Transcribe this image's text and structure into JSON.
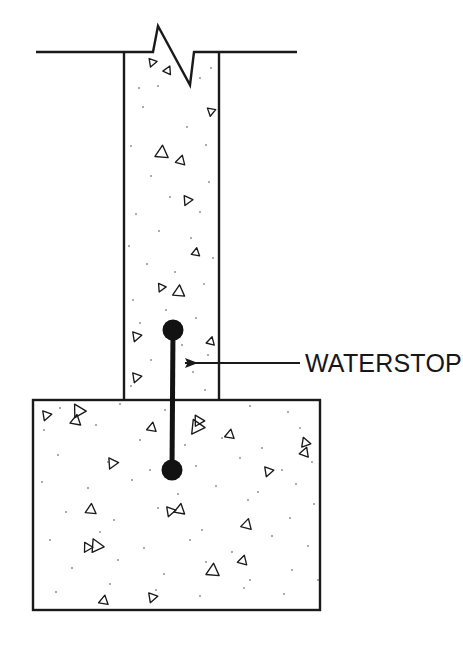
{
  "drawing": {
    "title": "Waterstop Detail",
    "type": "construction-section-detail",
    "background_color": "#ffffff",
    "line_color": "#1a1a1a",
    "fill_color": "#ffffff",
    "stipple_color": "#8a8a8a",
    "aggregate_color": "#1a1a1a",
    "waterstop_color": "#121212"
  },
  "annotation": {
    "label": "WATERSTOP",
    "leader_line": {
      "from_x": 300,
      "from_y": 363,
      "to_x": 185,
      "to_y": 363
    },
    "arrowhead": {
      "tip_x": 179,
      "tip_y": 363,
      "direction": "left"
    },
    "text_x": 305,
    "text_y": 372
  },
  "geometry": {
    "wall": {
      "name": "concrete-wall",
      "left_x": 124,
      "right_x": 219,
      "top_y": 52,
      "bottom_y": 400
    },
    "footing": {
      "name": "concrete-footing",
      "left_x": 33,
      "right_x": 320,
      "top_y": 400,
      "bottom_y": 610
    },
    "grade_line_left": {
      "x1": 36,
      "y1": 52,
      "x2": 124,
      "y2": 52
    },
    "grade_line_right": {
      "x1": 219,
      "y1": 52,
      "x2": 297,
      "y2": 52
    },
    "break_symbol": {
      "name": "break-line-zigzag",
      "points": "124,52 153,52 158,26 190,85 194,52 219,52"
    },
    "waterstop": {
      "name": "waterstop-dumbbell",
      "top_bulb": {
        "cx": 173,
        "cy": 330,
        "r": 10.5
      },
      "bottom_bulb": {
        "cx": 172,
        "cy": 470,
        "r": 10.5
      },
      "stem": {
        "x1": 173,
        "y1": 330,
        "x2": 172,
        "y2": 470,
        "width": 5
      }
    }
  },
  "hatching": {
    "description": "concrete section hatch: open triangles and fine dots",
    "wall_triangles": [
      {
        "x": 152,
        "y": 63,
        "size": 7,
        "rot": 200
      },
      {
        "x": 168,
        "y": 70,
        "size": 7,
        "rot": 25
      },
      {
        "x": 211,
        "y": 112,
        "size": 7,
        "rot": 190
      },
      {
        "x": 162,
        "y": 152,
        "size": 11,
        "rot": 5
      },
      {
        "x": 181,
        "y": 160,
        "size": 8,
        "rot": 15
      },
      {
        "x": 187,
        "y": 201,
        "size": 8,
        "rot": 205
      },
      {
        "x": 196,
        "y": 252,
        "size": 7,
        "rot": 10
      },
      {
        "x": 161,
        "y": 288,
        "size": 7,
        "rot": 205
      },
      {
        "x": 179,
        "y": 291,
        "size": 10,
        "rot": 5
      },
      {
        "x": 136,
        "y": 337,
        "size": 8,
        "rot": 200
      },
      {
        "x": 211,
        "y": 341,
        "size": 7,
        "rot": 15
      },
      {
        "x": 136,
        "y": 378,
        "size": 8,
        "rot": 200
      }
    ],
    "footing_triangles": [
      {
        "x": 46,
        "y": 416,
        "size": 8,
        "rot": 200
      },
      {
        "x": 78,
        "y": 410,
        "size": 11,
        "rot": 330
      },
      {
        "x": 76,
        "y": 420,
        "size": 9,
        "rot": 10
      },
      {
        "x": 152,
        "y": 427,
        "size": 8,
        "rot": 10
      },
      {
        "x": 196,
        "y": 428,
        "size": 12,
        "rot": 215
      },
      {
        "x": 198,
        "y": 420,
        "size": 9,
        "rot": 330
      },
      {
        "x": 230,
        "y": 434,
        "size": 8,
        "rot": 10
      },
      {
        "x": 305,
        "y": 442,
        "size": 8,
        "rot": 340
      },
      {
        "x": 305,
        "y": 452,
        "size": 8,
        "rot": 20
      },
      {
        "x": 112,
        "y": 464,
        "size": 9,
        "rot": 205
      },
      {
        "x": 268,
        "y": 472,
        "size": 8,
        "rot": 200
      },
      {
        "x": 91,
        "y": 509,
        "size": 9,
        "rot": 5
      },
      {
        "x": 170,
        "y": 512,
        "size": 8,
        "rot": 200
      },
      {
        "x": 180,
        "y": 509,
        "size": 9,
        "rot": 10
      },
      {
        "x": 247,
        "y": 524,
        "size": 9,
        "rot": 15
      },
      {
        "x": 87,
        "y": 548,
        "size": 8,
        "rot": 210
      },
      {
        "x": 96,
        "y": 545,
        "size": 11,
        "rot": 335
      },
      {
        "x": 243,
        "y": 560,
        "size": 8,
        "rot": 15
      },
      {
        "x": 213,
        "y": 570,
        "size": 11,
        "rot": 5
      },
      {
        "x": 104,
        "y": 600,
        "size": 8,
        "rot": 10
      },
      {
        "x": 152,
        "y": 598,
        "size": 8,
        "rot": 200
      }
    ],
    "wall_dots": [
      [
        139,
        88
      ],
      [
        158,
        86
      ],
      [
        200,
        78
      ],
      [
        211,
        68
      ],
      [
        143,
        107
      ],
      [
        187,
        127
      ],
      [
        206,
        145
      ],
      [
        131,
        146
      ],
      [
        151,
        176
      ],
      [
        209,
        182
      ],
      [
        170,
        197
      ],
      [
        136,
        214
      ],
      [
        200,
        212
      ],
      [
        159,
        231
      ],
      [
        191,
        238
      ],
      [
        129,
        246
      ],
      [
        213,
        258
      ],
      [
        147,
        264
      ],
      [
        175,
        272
      ],
      [
        204,
        284
      ],
      [
        133,
        300
      ],
      [
        166,
        310
      ],
      [
        196,
        318
      ],
      [
        140,
        323
      ],
      [
        182,
        345
      ],
      [
        208,
        355
      ],
      [
        151,
        360
      ],
      [
        193,
        372
      ],
      [
        131,
        386
      ],
      [
        171,
        392
      ],
      [
        205,
        390
      ]
    ],
    "footing_dots": [
      [
        60,
        408
      ],
      [
        120,
        404
      ],
      [
        165,
        410
      ],
      [
        250,
        406
      ],
      [
        288,
        412
      ],
      [
        44,
        430
      ],
      [
        96,
        425
      ],
      [
        140,
        440
      ],
      [
        185,
        445
      ],
      [
        222,
        438
      ],
      [
        262,
        448
      ],
      [
        300,
        428
      ],
      [
        58,
        455
      ],
      [
        108,
        462
      ],
      [
        150,
        470
      ],
      [
        196,
        466
      ],
      [
        240,
        458
      ],
      [
        282,
        470
      ],
      [
        312,
        462
      ],
      [
        42,
        482
      ],
      [
        88,
        488
      ],
      [
        132,
        480
      ],
      [
        178,
        494
      ],
      [
        216,
        486
      ],
      [
        258,
        492
      ],
      [
        296,
        484
      ],
      [
        66,
        512
      ],
      [
        114,
        520
      ],
      [
        158,
        508
      ],
      [
        202,
        530
      ],
      [
        248,
        500
      ],
      [
        290,
        518
      ],
      [
        314,
        504
      ],
      [
        50,
        540
      ],
      [
        100,
        532
      ],
      [
        144,
        548
      ],
      [
        190,
        540
      ],
      [
        232,
        552
      ],
      [
        272,
        536
      ],
      [
        308,
        546
      ],
      [
        72,
        568
      ],
      [
        118,
        560
      ],
      [
        164,
        574
      ],
      [
        206,
        562
      ],
      [
        250,
        580
      ],
      [
        292,
        570
      ],
      [
        56,
        592
      ],
      [
        110,
        584
      ],
      [
        156,
        590
      ],
      [
        200,
        596
      ],
      [
        244,
        588
      ],
      [
        284,
        594
      ],
      [
        318,
        580
      ]
    ]
  }
}
